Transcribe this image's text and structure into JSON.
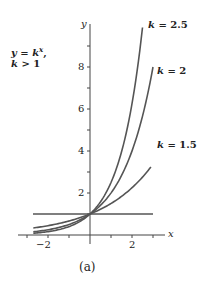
{
  "chart_data": {
    "type": "line",
    "title_lines": [
      "y = kˣ,",
      "k > 1"
    ],
    "xlabel": "x",
    "ylabel": "y",
    "caption": "(a)",
    "xlim": [
      -3.0,
      3.0
    ],
    "ylim": [
      0,
      10
    ],
    "x_ticks": [
      -2,
      -1,
      0,
      1,
      2
    ],
    "x_tick_labels": [
      "-2",
      "2"
    ],
    "x_tick_labels_display": [
      "−2",
      "2"
    ],
    "y_ticks": [
      1,
      2,
      3,
      4,
      5,
      6,
      7,
      8,
      9
    ],
    "y_tick_labels": [
      "2",
      "4",
      "6",
      "8"
    ],
    "grid": false,
    "legend": "inline labels at curve ends",
    "series": [
      {
        "name": "k = 2.5",
        "k": 2.5,
        "x_range": [
          -2.7,
          2.5
        ],
        "label": "k = 2.5",
        "color": "#555555"
      },
      {
        "name": "k = 2",
        "k": 2,
        "x_range": [
          -2.7,
          3.0
        ],
        "label": "k = 2",
        "color": "#555555"
      },
      {
        "name": "k = 1.5",
        "k": 1.5,
        "x_range": [
          -2.7,
          2.9
        ],
        "label": "k = 1.5",
        "color": "#555555"
      },
      {
        "name": "y = 1",
        "k": 1,
        "x_range": [
          -2.7,
          3.0
        ],
        "label": "",
        "color": "#555555"
      }
    ]
  },
  "labels": {
    "title_line1_a": "y",
    "title_line1_b": " = ",
    "title_line1_c": "k",
    "title_line1_sup": "x",
    "title_line1_d": ",",
    "title_line2_a": "k",
    "title_line2_b": " > 1",
    "y_axis": "y",
    "x_axis": "x",
    "k25_k": "k",
    "k25_val": " = 2.5",
    "k2_k": "k",
    "k2_val": " = 2",
    "k15_k": "k",
    "k15_val": " = 1.5",
    "ytick_8": "8",
    "ytick_6": "6",
    "ytick_4": "4",
    "ytick_2": "2",
    "xtick_m2": "−2",
    "xtick_2": "2",
    "caption": "(a)"
  }
}
